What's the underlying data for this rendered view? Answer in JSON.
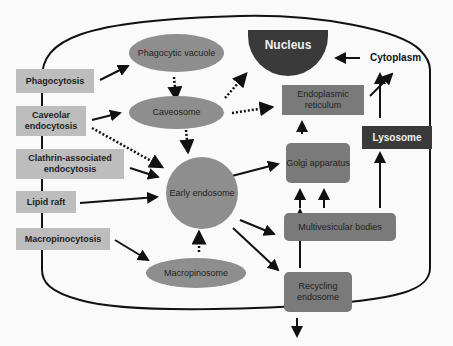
{
  "diagram": {
    "uptake_pathways": [
      "Phagocytosis",
      "Caveolar endocytosis",
      "Clathrin-associated endocytosis",
      "Lipid raft",
      "Macropinocytosis"
    ],
    "compartments": {
      "phagocytic_vacuole": "Phagocytic vacuole",
      "caveosome": "Caveosome",
      "early_endosome": "Early endosome",
      "macropinosome": "Macropinosome",
      "nucleus": "Nucleus",
      "endoplasmic_reticulum": "Endoplasmic reticulum",
      "golgi_apparatus": "Golgi apparatus",
      "multivesicular_bodies": "Multivesicular bodies",
      "recycling_endosome": "Recycling endosome",
      "lysosome": "Lysosome",
      "cytoplasm": "Cytoplasm"
    },
    "colors": {
      "light_box": "#bdbdbd",
      "mid_shape": "#8e8e8e",
      "dark_box": "#3a3a3a",
      "line": "#111111"
    }
  }
}
